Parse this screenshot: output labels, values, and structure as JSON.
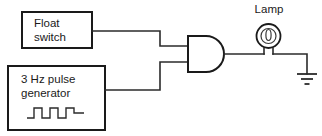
{
  "diagram": {
    "background_color": "#ffffff",
    "line_color": "#2b2b2b",
    "text_color": "#1a1a1a"
  },
  "components": {
    "float_switch": {
      "label_line1": "Float",
      "label_line2": "switch",
      "name": "float-switch-block"
    },
    "pulse_generator": {
      "label_line1": "3 Hz pulse",
      "label_line2": "generator",
      "waveform_name": "square-wave-glyph",
      "frequency": "3 Hz",
      "pulse_count": 3
    },
    "and_gate": {
      "label": "AND",
      "input_count": 2,
      "output_count": 1
    },
    "lamp": {
      "label": "Lamp",
      "symbol": "lamp-bulb-icon"
    },
    "ground": {
      "label": "",
      "symbol": "earth-ground-icon",
      "bar_count": 3
    }
  },
  "connections": [
    {
      "name": "float-switch-to-and-input-a",
      "from": "float_switch",
      "to": "and_gate"
    },
    {
      "name": "pulse-generator-to-and-input-b",
      "from": "pulse_generator",
      "to": "and_gate"
    },
    {
      "name": "and-output-to-lamp",
      "from": "and_gate",
      "to": "lamp"
    },
    {
      "name": "lamp-to-ground",
      "from": "lamp",
      "to": "ground"
    }
  ]
}
